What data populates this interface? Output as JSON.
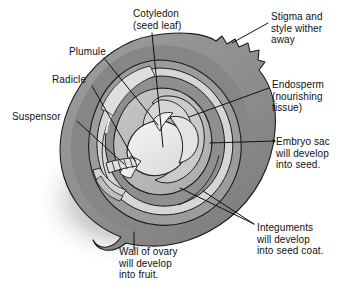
{
  "figure": {
    "background_color": "#ffffff",
    "ink_color": "#111111",
    "palette": {
      "ovary_wall": "#8e8e8e",
      "ovary_wall_dark": "#7a7a7a",
      "integument_outer": "#9b9b9b",
      "integument_light": "#d8d8d8",
      "embryo_sac": "#b9b9b9",
      "endosperm": "#c9c9c9",
      "embryo": "#e9e9e9",
      "shadow": "#9a9a9a"
    }
  },
  "labels": {
    "cotyledon": {
      "name": "cotyledon",
      "lines": [
        "Cotyledon",
        "(seed leaf)"
      ],
      "text": "Cotyledon\n(seed leaf)",
      "position": "top-center"
    },
    "stigma": {
      "name": "stigma-and-style",
      "lines": [
        "Stigma and",
        "style wither",
        "away"
      ],
      "text": "Stigma and\nstyle wither\naway",
      "position": "top-right"
    },
    "plumule": {
      "name": "plumule",
      "lines": [
        "Plumule"
      ],
      "text": "Plumule",
      "position": "upper-left"
    },
    "radicle": {
      "name": "radicle",
      "lines": [
        "Radicle"
      ],
      "text": "Radicle",
      "position": "left"
    },
    "suspensor": {
      "name": "suspensor",
      "lines": [
        "Suspensor"
      ],
      "text": "Suspensor",
      "position": "left"
    },
    "endosperm": {
      "name": "endosperm",
      "lines": [
        "Endosperm",
        "(nourishing",
        "tissue)"
      ],
      "text": "Endosperm\n(nourishing\ntissue)",
      "position": "right"
    },
    "embryo_sac": {
      "name": "embryo-sac",
      "lines": [
        "Embryo sac",
        "will develop",
        "into seed."
      ],
      "text": "Embryo sac\nwill develop\ninto seed.",
      "position": "right"
    },
    "integuments": {
      "name": "integuments",
      "lines": [
        "Integuments",
        "will develop",
        "into seed coat."
      ],
      "text": "Integuments\nwill develop\ninto seed coat.",
      "position": "bottom-right"
    },
    "wall_of_ovary": {
      "name": "wall-of-ovary",
      "lines": [
        "Wall of ovary",
        "will develop",
        "into fruit."
      ],
      "text": "Wall of ovary\nwill develop\ninto fruit.",
      "position": "bottom-center"
    }
  }
}
